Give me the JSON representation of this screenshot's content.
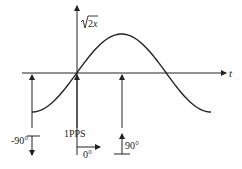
{
  "diagram": {
    "title": "",
    "axes": {
      "horizontal_label": "t",
      "vertical_label": "√2x"
    },
    "waveform": {
      "type": "sine",
      "cycles": 1,
      "start_phase_deg": -90
    },
    "markers": [
      {
        "id": "minus90",
        "label": "-90°",
        "direction": "down"
      },
      {
        "id": "zero",
        "label": "0°",
        "direction": "right",
        "reference": "1PPS"
      },
      {
        "id": "plus90",
        "label": "90°",
        "direction": "up"
      }
    ],
    "reference_label": "1PPS",
    "colors": {
      "line": "#222222",
      "background": "#ffffff"
    }
  }
}
